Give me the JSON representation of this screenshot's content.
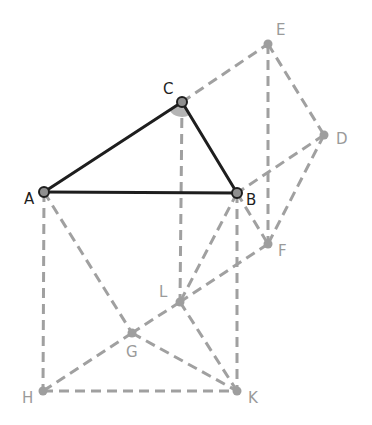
{
  "diagram": {
    "title": "",
    "colors": {
      "background": "#ffffff",
      "solid": "#1e1e1e",
      "dashed": "#a0a0a0",
      "point_primary": "#8f8f8f",
      "point_secondary": "#9e9e9e",
      "angle_fill": "#b4b4b4",
      "label_primary": "#1e1e1e",
      "label_secondary": "#9a9a9a"
    },
    "points": {
      "A": {
        "label": "A",
        "x": 44,
        "y": 192,
        "lx": 24,
        "ly": 204,
        "primary": true
      },
      "B": {
        "label": "B",
        "x": 237,
        "y": 193,
        "lx": 246,
        "ly": 205,
        "primary": true
      },
      "C": {
        "label": "C",
        "x": 182,
        "y": 102,
        "lx": 163,
        "ly": 94,
        "primary": true
      },
      "D": {
        "label": "D",
        "x": 324,
        "y": 135,
        "lx": 336,
        "ly": 144,
        "primary": false
      },
      "E": {
        "label": "E",
        "x": 268,
        "y": 44,
        "lx": 276,
        "ly": 35,
        "primary": false
      },
      "F": {
        "label": "F",
        "x": 268,
        "y": 244,
        "lx": 278,
        "ly": 256,
        "primary": false
      },
      "G": {
        "label": "G",
        "x": 132,
        "y": 333,
        "lx": 126,
        "ly": 357,
        "primary": false
      },
      "H": {
        "label": "H",
        "x": 43,
        "y": 391,
        "lx": 22,
        "ly": 403,
        "primary": false
      },
      "K": {
        "label": "K",
        "x": 237,
        "y": 391,
        "lx": 248,
        "ly": 403,
        "primary": false
      },
      "L": {
        "label": "L",
        "x": 180,
        "y": 302,
        "lx": 159,
        "ly": 297,
        "primary": false
      }
    },
    "solid_segments": [
      [
        "A",
        "C"
      ],
      [
        "C",
        "B"
      ],
      [
        "A",
        "B"
      ]
    ],
    "dashed_segments": [
      [
        "C",
        "E"
      ],
      [
        "E",
        "D"
      ],
      [
        "D",
        "B"
      ],
      [
        "E",
        "F"
      ],
      [
        "D",
        "F"
      ],
      [
        "B",
        "F"
      ],
      [
        "F",
        "L"
      ],
      [
        "L",
        "G"
      ],
      [
        "G",
        "H"
      ],
      [
        "A",
        "H"
      ],
      [
        "H",
        "K"
      ],
      [
        "B",
        "K"
      ],
      [
        "A",
        "G"
      ],
      [
        "G",
        "K"
      ],
      [
        "C",
        "L"
      ],
      [
        "B",
        "L"
      ],
      [
        "L",
        "K"
      ]
    ],
    "angle_marker": {
      "vertex": "C",
      "radius": 15,
      "from": "A",
      "to": "B"
    }
  }
}
